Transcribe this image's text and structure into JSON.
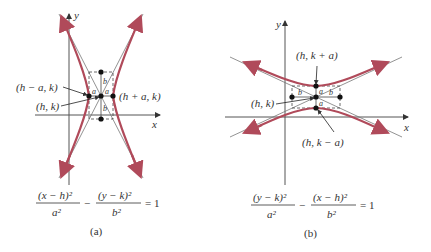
{
  "colors": {
    "curve": "#b04a5a",
    "axis": "#555555",
    "asymptote": "#666666",
    "box": "#444444",
    "point": "#111111"
  },
  "panel_a": {
    "axis_x_label": "x",
    "axis_y_label": "y",
    "label_left_vertex": "(h − a, k)",
    "label_center": "(h, k)",
    "label_right_vertex": "(h + a, k)",
    "seg_a": "a",
    "seg_b": "b",
    "equation": {
      "term1_num": "(x − h)²",
      "term1_den": "a²",
      "minus": "−",
      "term2_num": "(y − k)²",
      "term2_den": "b²",
      "rhs": "= 1"
    },
    "caption": "(a)",
    "orientation": "horizontal transverse axis"
  },
  "panel_b": {
    "axis_x_label": "x",
    "axis_y_label": "y",
    "label_top_vertex": "(h, k + a)",
    "label_center": "(h, k)",
    "label_bottom_vertex": "(h, k − a)",
    "seg_a": "a",
    "seg_b": "b",
    "equation": {
      "term1_num": "(y − k)²",
      "term1_den": "a²",
      "minus": "−",
      "term2_num": "(x − h)²",
      "term2_den": "b²",
      "rhs": "= 1"
    },
    "caption": "(b)",
    "orientation": "vertical transverse axis"
  }
}
